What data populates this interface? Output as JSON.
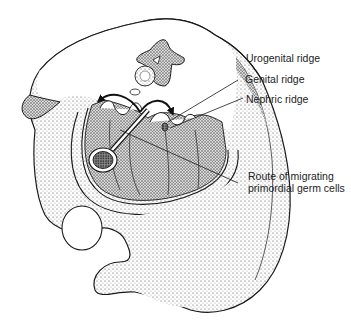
{
  "figure": {
    "labels": {
      "urogenital_ridge": "Urogenital ridge",
      "genital_ridge": "Genital ridge",
      "nephric_ridge": "Nephric ridge",
      "route": "Route of migrating primordial germ cells"
    },
    "colors": {
      "line": "#1a1a1a",
      "stipple": "#555555",
      "background": "#ffffff"
    }
  }
}
